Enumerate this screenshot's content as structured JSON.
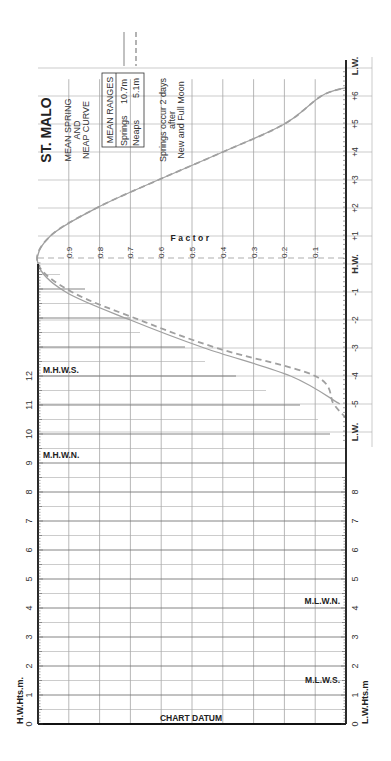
{
  "title": "ST. MALO",
  "subtitle_lines": [
    "MEAN SPRING",
    "AND",
    "NEAP CURVE"
  ],
  "mean_ranges": {
    "header": "MEAN RANGES",
    "springs_label": "Springs",
    "springs_value": "10.7m",
    "neaps_label": "Neaps",
    "neaps_value": "5.1m"
  },
  "note_lines": [
    "Springs occur 2 days",
    "after",
    "New and Full Moon"
  ],
  "factor_label": "Factor",
  "factor_ticks": [
    "0.9",
    "0.8",
    "0.7",
    "0.6",
    "0.5",
    "0.4",
    "0.3",
    "0.2",
    "0.1"
  ],
  "time_axis": {
    "labels": [
      "L.W.",
      "+6h",
      "+5h",
      "+4h",
      "+3h",
      "+2h",
      "+1h",
      "H.W.",
      "-1h",
      "-2h",
      "-3h",
      "-4h",
      "-5h",
      "L.W."
    ]
  },
  "hw_heights_label": "H.W.Hts.m.",
  "lw_heights_label": "L.W.Hts.m",
  "height_ticks": [
    "0",
    "1",
    "2",
    "3",
    "4",
    "5",
    "6",
    "7",
    "8",
    "9",
    "10",
    "11",
    "12"
  ],
  "lw_height_ticks": [
    "0",
    "1",
    "2",
    "3",
    "4",
    "5",
    "6",
    "7",
    "8"
  ],
  "markers": {
    "mhws": "M.H.W.S.",
    "mhwn": "M.H.W.N.",
    "mlwn": "M.L.W.N.",
    "mlws": "M.L.W.S."
  },
  "chart_datum_label": "CHART DATUM",
  "colors": {
    "curve": "#a0a0a0",
    "grid": "#8a8a8a",
    "axis": "#111111",
    "text": "#333333"
  },
  "chart_data": {
    "type": "line",
    "title": "ST. MALO Mean Spring and Neap Curve",
    "xlabel": "Time from H.W. (hours)",
    "ylabel": "Factor",
    "ylim": [
      0,
      1
    ],
    "x": [
      -6,
      -5.5,
      -5,
      -4,
      -3,
      -2,
      -1,
      0,
      1,
      2,
      3,
      4,
      5,
      6,
      6.3
    ],
    "series": [
      {
        "name": "Springs (10.7m)",
        "style": "solid",
        "values": [
          null,
          null,
          0.02,
          0.18,
          0.46,
          0.7,
          0.91,
          1.0,
          0.96,
          0.81,
          0.61,
          0.4,
          0.2,
          0.08,
          0.0
        ]
      },
      {
        "name": "Neaps (5.1m)",
        "style": "dashed",
        "values": [
          null,
          0.0,
          0.04,
          0.1,
          0.42,
          0.67,
          0.89,
          1.0,
          0.96,
          0.81,
          0.61,
          0.4,
          0.2,
          0.08,
          0.0
        ]
      }
    ],
    "height_scale_m": [
      0,
      12
    ],
    "markers_m": {
      "MHWS": 12.2,
      "MHWN": 9.3,
      "MLWN": 4.2,
      "MLWS": 1.4
    },
    "grid": true
  }
}
